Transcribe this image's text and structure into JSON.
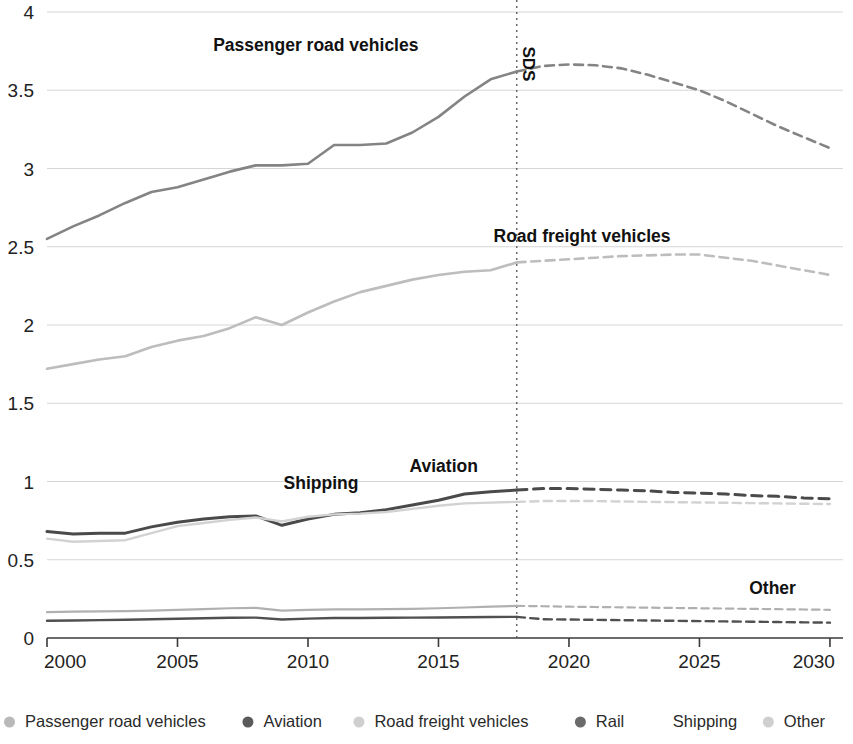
{
  "chart_data": {
    "type": "line",
    "title": "",
    "subtitle": "",
    "xlabel": "",
    "ylabel": "",
    "xlim": [
      2000,
      2030.5
    ],
    "ylim": [
      0,
      4
    ],
    "grid": true,
    "legend_position": "bottom",
    "x_ticks": [
      "2000",
      "2005",
      "2010",
      "2015",
      "2020",
      "2025",
      "2030"
    ],
    "x_tick_values": [
      2000,
      2005,
      2010,
      2015,
      2020,
      2025,
      2030
    ],
    "y_ticks": [
      "0",
      "0.5",
      "1",
      "1.5",
      "2",
      "2.5",
      "3",
      "3.5",
      "4"
    ],
    "y_tick_values": [
      0,
      0.5,
      1,
      1.5,
      2,
      2.5,
      3,
      3.5,
      4
    ],
    "projection_start": 2018,
    "annotations": [
      {
        "text": "SDS",
        "x": 2018,
        "y": 3.78,
        "rotated": true
      },
      {
        "text": "Passenger road vehicles",
        "x": 2010.3,
        "y": 3.75
      },
      {
        "text": "Road freight vehicles",
        "x": 2020.5,
        "y": 2.53
      },
      {
        "text": "Aviation",
        "x": 2015.2,
        "y": 1.06
      },
      {
        "text": "Shipping",
        "x": 2010.5,
        "y": 0.95
      },
      {
        "text": "Other",
        "x": 2027.8,
        "y": 0.28
      }
    ],
    "x": [
      2000,
      2001,
      2002,
      2003,
      2004,
      2005,
      2006,
      2007,
      2008,
      2009,
      2010,
      2011,
      2012,
      2013,
      2014,
      2015,
      2016,
      2017,
      2018,
      2019,
      2020,
      2021,
      2022,
      2023,
      2024,
      2025,
      2026,
      2027,
      2028,
      2029,
      2030
    ],
    "series": [
      {
        "name": "Passenger road vehicles",
        "color": "#848484",
        "width": 2.6,
        "values": [
          2.55,
          2.63,
          2.7,
          2.78,
          2.85,
          2.88,
          2.93,
          2.98,
          3.02,
          3.02,
          3.03,
          3.15,
          3.15,
          3.16,
          3.23,
          3.33,
          3.46,
          3.57,
          3.62,
          3.655,
          3.665,
          3.66,
          3.64,
          3.6,
          3.55,
          3.5,
          3.43,
          3.35,
          3.27,
          3.2,
          3.13
        ]
      },
      {
        "name": "Road freight vehicles",
        "color": "#bdbdbd",
        "width": 2.6,
        "values": [
          1.72,
          1.75,
          1.78,
          1.8,
          1.86,
          1.9,
          1.93,
          1.98,
          2.05,
          2.0,
          2.08,
          2.15,
          2.21,
          2.25,
          2.29,
          2.32,
          2.34,
          2.35,
          2.4,
          2.41,
          2.42,
          2.43,
          2.44,
          2.445,
          2.45,
          2.45,
          2.43,
          2.41,
          2.38,
          2.35,
          2.32
        ]
      },
      {
        "name": "Aviation",
        "color": "#4a4a4a",
        "width": 3.0,
        "values": [
          0.68,
          0.665,
          0.67,
          0.67,
          0.71,
          0.74,
          0.76,
          0.775,
          0.78,
          0.72,
          0.76,
          0.79,
          0.8,
          0.82,
          0.85,
          0.88,
          0.92,
          0.935,
          0.945,
          0.955,
          0.955,
          0.95,
          0.945,
          0.94,
          0.93,
          0.925,
          0.92,
          0.91,
          0.905,
          0.895,
          0.89
        ]
      },
      {
        "name": "Shipping",
        "color": "#d2d2d2",
        "width": 2.4,
        "values": [
          0.635,
          0.615,
          0.62,
          0.625,
          0.67,
          0.715,
          0.735,
          0.755,
          0.77,
          0.745,
          0.775,
          0.79,
          0.795,
          0.805,
          0.825,
          0.845,
          0.86,
          0.865,
          0.87,
          0.875,
          0.875,
          0.875,
          0.872,
          0.87,
          0.868,
          0.866,
          0.864,
          0.862,
          0.86,
          0.858,
          0.856
        ]
      },
      {
        "name": "Other",
        "color": "#b0b0b0",
        "width": 2.2,
        "values": [
          0.165,
          0.168,
          0.17,
          0.172,
          0.175,
          0.18,
          0.185,
          0.19,
          0.192,
          0.175,
          0.18,
          0.183,
          0.183,
          0.184,
          0.186,
          0.19,
          0.195,
          0.2,
          0.205,
          0.203,
          0.2,
          0.198,
          0.196,
          0.194,
          0.192,
          0.19,
          0.188,
          0.186,
          0.184,
          0.182,
          0.18
        ]
      },
      {
        "name": "Rail",
        "color": "#505050",
        "width": 2.4,
        "values": [
          0.11,
          0.112,
          0.114,
          0.117,
          0.12,
          0.123,
          0.126,
          0.129,
          0.13,
          0.118,
          0.124,
          0.128,
          0.128,
          0.129,
          0.13,
          0.131,
          0.133,
          0.134,
          0.135,
          0.12,
          0.118,
          0.116,
          0.114,
          0.112,
          0.11,
          0.108,
          0.106,
          0.104,
          0.102,
          0.1,
          0.098
        ]
      }
    ],
    "legend": [
      {
        "label": "Passenger road vehicles",
        "color": "#b9b9b9"
      },
      {
        "label": "Aviation",
        "color": "#5a5a5a"
      },
      {
        "label": "Road freight vehicles",
        "color": "#cfcfcf"
      },
      {
        "label": "Rail",
        "color": "#6a6a6a"
      },
      {
        "label": "Shipping",
        "color": "#ffffff"
      },
      {
        "label": "Other",
        "color": "#cfcfcf"
      }
    ]
  }
}
